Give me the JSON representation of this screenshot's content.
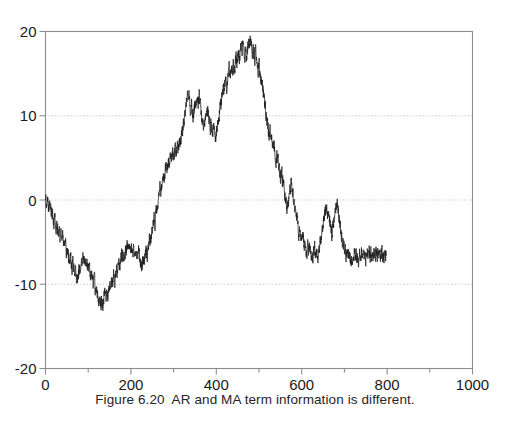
{
  "caption": "Figure 6.20  AR and MA term information is different.",
  "colors": {
    "line": "#1c1c1c",
    "frame": "#8c8c8c",
    "grid": "#b0b0b0",
    "text": "#1a1a1a",
    "background": "#ffffff"
  },
  "chart_data": {
    "type": "line",
    "title": "",
    "xlabel": "",
    "ylabel": "",
    "xlim": [
      0,
      1000
    ],
    "ylim": [
      -20,
      20
    ],
    "grid": true,
    "grid_values": [
      10,
      0,
      -10
    ],
    "legend": null,
    "xticks": [
      0,
      200,
      400,
      600,
      800,
      1000
    ],
    "xtick_labels": [
      "0",
      "200",
      "400",
      "600",
      "800",
      "1000"
    ],
    "xminor_step": 100,
    "yticks": [
      20,
      10,
      0,
      -10,
      -20
    ],
    "ytick_labels": [
      "20",
      "10",
      "0",
      "-10",
      "-20"
    ],
    "series": [
      {
        "name": "simulated series",
        "x_start": 0,
        "x_step": 2,
        "values": [
          0.2,
          -0.4,
          0.3,
          -0.6,
          -1.1,
          -0.5,
          -1.4,
          -2.0,
          -1.5,
          -2.3,
          -2.9,
          -2.4,
          -3.2,
          -2.7,
          -3.5,
          -4.2,
          -3.6,
          -4.4,
          -3.9,
          -4.8,
          -4.2,
          -5.0,
          -5.7,
          -5.1,
          -5.9,
          -6.5,
          -5.8,
          -6.6,
          -7.2,
          -6.5,
          -7.4,
          -8.1,
          -7.5,
          -8.4,
          -9.1,
          -8.5,
          -9.4,
          -9.9,
          -9.2,
          -8.5,
          -7.9,
          -8.6,
          -7.8,
          -7.1,
          -6.6,
          -7.3,
          -6.8,
          -7.5,
          -6.9,
          -7.6,
          -8.3,
          -7.6,
          -8.4,
          -9.2,
          -8.5,
          -9.3,
          -10.1,
          -9.4,
          -10.2,
          -11.0,
          -10.3,
          -11.1,
          -11.9,
          -11.2,
          -12.0,
          -12.7,
          -12.1,
          -12.9,
          -12.2,
          -11.5,
          -10.8,
          -11.5,
          -10.7,
          -11.4,
          -10.6,
          -9.8,
          -10.5,
          -9.7,
          -10.4,
          -9.6,
          -8.9,
          -9.6,
          -8.8,
          -8.1,
          -8.8,
          -8.0,
          -7.3,
          -8.0,
          -7.2,
          -6.5,
          -7.2,
          -6.4,
          -7.1,
          -6.3,
          -5.6,
          -6.3,
          -5.5,
          -6.2,
          -5.4,
          -6.1,
          -5.3,
          -6.0,
          -6.7,
          -6.0,
          -6.8,
          -6.1,
          -6.9,
          -6.2,
          -7.0,
          -6.3,
          -7.1,
          -7.9,
          -7.2,
          -8.0,
          -7.3,
          -6.6,
          -7.3,
          -6.5,
          -5.8,
          -6.5,
          -5.7,
          -5.0,
          -4.3,
          -5.0,
          -4.2,
          -3.5,
          -2.8,
          -2.1,
          -2.8,
          -2.0,
          -1.3,
          -0.6,
          0.1,
          0.8,
          1.5,
          0.8,
          1.6,
          2.3,
          3.0,
          2.3,
          3.1,
          3.8,
          3.1,
          3.9,
          4.6,
          3.9,
          4.7,
          5.4,
          4.7,
          5.5,
          4.8,
          5.6,
          6.3,
          5.6,
          6.4,
          5.7,
          6.5,
          7.2,
          6.5,
          7.3,
          8.0,
          8.7,
          9.4,
          10.1,
          10.8,
          11.5,
          12.2,
          12.9,
          12.2,
          11.5,
          10.8,
          11.5,
          10.7,
          10.0,
          10.7,
          11.4,
          10.7,
          11.4,
          12.1,
          11.4,
          12.1,
          11.4,
          10.7,
          10.0,
          9.3,
          8.6,
          9.3,
          10.0,
          9.3,
          10.0,
          10.7,
          10.0,
          9.3,
          8.6,
          9.3,
          8.5,
          7.8,
          8.5,
          7.7,
          7.0,
          7.7,
          8.4,
          9.1,
          9.8,
          10.5,
          11.2,
          11.9,
          12.6,
          13.3,
          12.6,
          13.3,
          14.0,
          13.3,
          14.0,
          14.7,
          15.4,
          14.7,
          15.4,
          16.1,
          15.4,
          16.1,
          15.4,
          16.1,
          16.8,
          16.1,
          16.8,
          17.5,
          16.8,
          17.5,
          18.2,
          17.5,
          18.2,
          17.5,
          16.8,
          17.5,
          16.8,
          17.5,
          18.2,
          18.9,
          18.2,
          18.9,
          18.2,
          17.5,
          18.2,
          17.5,
          16.8,
          17.5,
          16.8,
          16.1,
          15.4,
          16.1,
          15.4,
          14.7,
          14.0,
          13.3,
          12.6,
          11.9,
          11.2,
          10.5,
          9.8,
          9.1,
          8.4,
          7.7,
          8.4,
          7.7,
          7.0,
          6.3,
          7.0,
          6.3,
          5.6,
          4.9,
          5.6,
          4.9,
          4.2,
          3.5,
          2.8,
          3.5,
          2.8,
          2.1,
          1.4,
          0.7,
          0.0,
          -0.7,
          -1.4,
          -0.7,
          0.0,
          0.7,
          1.4,
          2.1,
          1.4,
          0.7,
          0.0,
          -0.7,
          -1.4,
          -2.1,
          -2.8,
          -3.5,
          -4.2,
          -3.5,
          -4.2,
          -4.9,
          -4.2,
          -4.9,
          -5.6,
          -4.9,
          -5.6,
          -6.3,
          -5.6,
          -6.3,
          -5.6,
          -6.3,
          -7.0,
          -6.3,
          -7.0,
          -6.3,
          -5.6,
          -6.3,
          -5.6,
          -6.3,
          -7.0,
          -6.3,
          -5.6,
          -4.9,
          -4.2,
          -3.5,
          -2.8,
          -2.1,
          -1.4,
          -0.7,
          -1.4,
          -2.1,
          -1.4,
          -2.1,
          -2.8,
          -3.5,
          -4.2,
          -3.5,
          -2.8,
          -2.1,
          -1.4,
          -0.7,
          0.0,
          -0.7,
          -1.4,
          -2.1,
          -2.8,
          -3.5,
          -4.2,
          -4.9,
          -5.6,
          -6.3,
          -5.6,
          -6.3,
          -5.6,
          -6.3,
          -7.0,
          -6.3,
          -7.0,
          -7.7,
          -7.0,
          -7.7,
          -7.0,
          -6.3,
          -7.0,
          -6.3,
          -7.0,
          -7.7,
          -7.0,
          -6.3,
          -7.0,
          -6.3,
          -7.0,
          -6.5,
          -7.2,
          -6.5,
          -7.2,
          -6.5,
          -6.0,
          -6.7,
          -6.2,
          -6.9,
          -6.3,
          -6.8,
          -6.2,
          -6.7,
          -6.1,
          -6.6,
          -6.2,
          -6.7,
          -6.3,
          -6.8,
          -6.4,
          -6.9,
          -6.5,
          -6.2,
          -6.7,
          -6.3,
          -6.8,
          -6.4,
          -6.6
        ]
      }
    ]
  }
}
